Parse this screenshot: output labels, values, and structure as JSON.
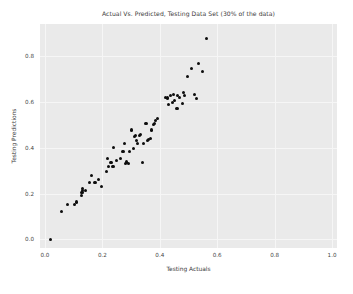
{
  "chart_data": {
    "type": "scatter",
    "title": "Actual Vs. Predicted, Testing Data Set (30% of the data)",
    "xlabel": "Testing Actuals",
    "ylabel": "Testing Predictions",
    "xlim": [
      -0.0172,
      1.0172
    ],
    "ylim": [
      -0.0384,
      0.9416
    ],
    "xticks": [
      0.0,
      0.2,
      0.4,
      0.6,
      0.8,
      1.0
    ],
    "xtick_labels": [
      "0.0",
      "0.2",
      "0.4",
      "0.6",
      "0.8",
      "1.0"
    ],
    "yticks": [
      0.0,
      0.2,
      0.4,
      0.6,
      0.8
    ],
    "ytick_labels": [
      "0.0",
      "0.2",
      "0.4",
      "0.6",
      "0.8"
    ],
    "grid": true,
    "grid_color": "#f6f6f6",
    "plot_bg_color": "#eaeaea",
    "figure_bg_color": "#ffffff",
    "marker_color": "#0d0d0d",
    "marker_size": 3.1,
    "legend": null,
    "points": [
      [
        0.02,
        0.0
      ],
      [
        0.057,
        0.12
      ],
      [
        0.079,
        0.153
      ],
      [
        0.103,
        0.15
      ],
      [
        0.11,
        0.163
      ],
      [
        0.127,
        0.192
      ],
      [
        0.129,
        0.203
      ],
      [
        0.13,
        0.212
      ],
      [
        0.132,
        0.22
      ],
      [
        0.14,
        0.212
      ],
      [
        0.155,
        0.25
      ],
      [
        0.163,
        0.28
      ],
      [
        0.172,
        0.247
      ],
      [
        0.175,
        0.25
      ],
      [
        0.187,
        0.262
      ],
      [
        0.196,
        0.232
      ],
      [
        0.215,
        0.297
      ],
      [
        0.218,
        0.355
      ],
      [
        0.221,
        0.318
      ],
      [
        0.23,
        0.337
      ],
      [
        0.237,
        0.32
      ],
      [
        0.24,
        0.4
      ],
      [
        0.248,
        0.345
      ],
      [
        0.262,
        0.355
      ],
      [
        0.272,
        0.382
      ],
      [
        0.276,
        0.42
      ],
      [
        0.281,
        0.33
      ],
      [
        0.285,
        0.338
      ],
      [
        0.291,
        0.332
      ],
      [
        0.295,
        0.384
      ],
      [
        0.3,
        0.478
      ],
      [
        0.31,
        0.398
      ],
      [
        0.312,
        0.448
      ],
      [
        0.315,
        0.452
      ],
      [
        0.318,
        0.432
      ],
      [
        0.322,
        0.42
      ],
      [
        0.328,
        0.455
      ],
      [
        0.332,
        0.46
      ],
      [
        0.34,
        0.335
      ],
      [
        0.344,
        0.42
      ],
      [
        0.352,
        0.505
      ],
      [
        0.358,
        0.43
      ],
      [
        0.361,
        0.435
      ],
      [
        0.368,
        0.44
      ],
      [
        0.37,
        0.478
      ],
      [
        0.377,
        0.5
      ],
      [
        0.383,
        0.505
      ],
      [
        0.386,
        0.518
      ],
      [
        0.392,
        0.528
      ],
      [
        0.42,
        0.62
      ],
      [
        0.427,
        0.618
      ],
      [
        0.431,
        0.59
      ],
      [
        0.438,
        0.628
      ],
      [
        0.443,
        0.598
      ],
      [
        0.447,
        0.632
      ],
      [
        0.452,
        0.605
      ],
      [
        0.46,
        0.57
      ],
      [
        0.462,
        0.63
      ],
      [
        0.47,
        0.622
      ],
      [
        0.478,
        0.595
      ],
      [
        0.483,
        0.64
      ],
      [
        0.486,
        0.628
      ],
      [
        0.497,
        0.712
      ],
      [
        0.512,
        0.748
      ],
      [
        0.52,
        0.632
      ],
      [
        0.527,
        0.614
      ],
      [
        0.535,
        0.77
      ],
      [
        0.55,
        0.735
      ],
      [
        0.562,
        0.88
      ]
    ]
  }
}
